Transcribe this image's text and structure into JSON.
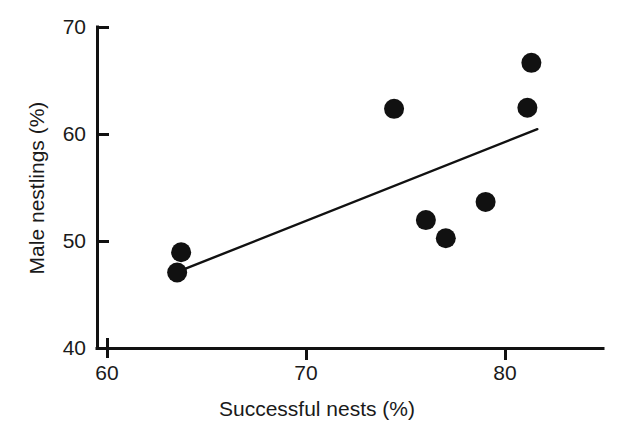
{
  "chart_data": {
    "type": "scatter",
    "title": "",
    "xlabel": "Successful nests (%)",
    "ylabel": "Male nestlings (%)",
    "xlim": [
      60,
      82
    ],
    "ylim": [
      40,
      70
    ],
    "xticks": [
      60,
      70,
      80
    ],
    "xtick_labels": [
      "60",
      "70",
      "80"
    ],
    "yticks": [
      40,
      50,
      60,
      70
    ],
    "ytick_labels": [
      "40",
      "50",
      "60",
      "70"
    ],
    "grid": false,
    "legend": null,
    "marker": {
      "shape": "circle",
      "color": "#111111",
      "size_px": 20
    },
    "points": [
      {
        "x": 63.7,
        "y": 49.0
      },
      {
        "x": 63.5,
        "y": 47.1
      },
      {
        "x": 74.4,
        "y": 62.4
      },
      {
        "x": 76.0,
        "y": 52.0
      },
      {
        "x": 77.0,
        "y": 50.3
      },
      {
        "x": 79.0,
        "y": 53.7
      },
      {
        "x": 81.3,
        "y": 66.7
      },
      {
        "x": 81.1,
        "y": 62.5
      }
    ],
    "trend_line": {
      "type": "linear-fit",
      "color": "#111111",
      "x_start": 63.7,
      "y_start": 47.3,
      "x_end": 81.6,
      "y_end": 60.5
    },
    "axis_color": "#111111"
  },
  "axes": {
    "x_axis_name": "successful-nests-axis",
    "y_axis_name": "male-nestlings-axis"
  }
}
